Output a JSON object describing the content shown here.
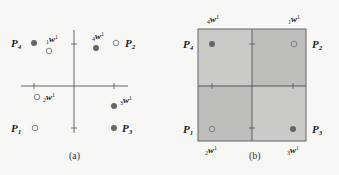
{
  "colors": {
    "background": "#f7f7f5",
    "axis": "#555555",
    "filled_point": "#666666",
    "hollow_point_stroke": "#777777",
    "quad_light": "#c9c9c6",
    "quad_dark": "#bdbdba",
    "box_border": "#666666"
  },
  "panel_a": {
    "caption": "(a)",
    "points": [
      {
        "id": "P4",
        "label": "P",
        "sub": "4",
        "type": "filled"
      },
      {
        "id": "1w1",
        "label": "w",
        "pre": "1",
        "sup": "1",
        "type": "hollow"
      },
      {
        "id": "4w1",
        "label": "w",
        "pre": "4",
        "sup": "1",
        "type": "filled"
      },
      {
        "id": "P2",
        "label": "P",
        "sub": "2",
        "type": "hollow"
      },
      {
        "id": "2w1",
        "label": "w",
        "pre": "2",
        "sup": "1",
        "type": "hollow"
      },
      {
        "id": "3w1",
        "label": "w",
        "pre": "3",
        "sup": "1",
        "type": "filled"
      },
      {
        "id": "P1",
        "label": "P",
        "sub": "1",
        "type": "hollow"
      },
      {
        "id": "P3",
        "label": "P",
        "sub": "3",
        "type": "filled"
      }
    ]
  },
  "panel_b": {
    "caption": "(b)",
    "corner_labels": {
      "top_left": {
        "label": "w",
        "pre": "4",
        "sup": "1"
      },
      "top_right": {
        "label": "w",
        "pre": "1",
        "sup": "1"
      },
      "bottom_left": {
        "label": "w",
        "pre": "2",
        "sup": "1"
      },
      "bottom_right": {
        "label": "w",
        "pre": "3",
        "sup": "1"
      }
    },
    "points": [
      {
        "id": "P4",
        "label": "P",
        "sub": "4",
        "type": "filled"
      },
      {
        "id": "P2",
        "label": "P",
        "sub": "2",
        "type": "hollow"
      },
      {
        "id": "P1",
        "label": "P",
        "sub": "1",
        "type": "hollow"
      },
      {
        "id": "P3",
        "label": "P",
        "sub": "3",
        "type": "filled"
      }
    ]
  }
}
